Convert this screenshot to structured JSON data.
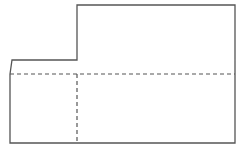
{
  "diagram": {
    "type": "unfolded-net",
    "canvas": {
      "width": 245,
      "height": 151,
      "background": "#ffffff"
    },
    "stroke_color": "#555555",
    "solid_stroke_width": 1.3,
    "dashed_stroke_width": 1.2,
    "dash_pattern": "4 3",
    "solid_outline": {
      "points": "10,74 12,60 77,60 77,5 235,5 235,143 10,143 10,74"
    },
    "fold_lines": [
      {
        "name": "horizontal-fold-line",
        "x1": 10,
        "y1": 74,
        "x2": 235,
        "y2": 74
      },
      {
        "name": "vertical-fold-line",
        "x1": 77,
        "y1": 74,
        "x2": 77,
        "y2": 143
      }
    ]
  }
}
